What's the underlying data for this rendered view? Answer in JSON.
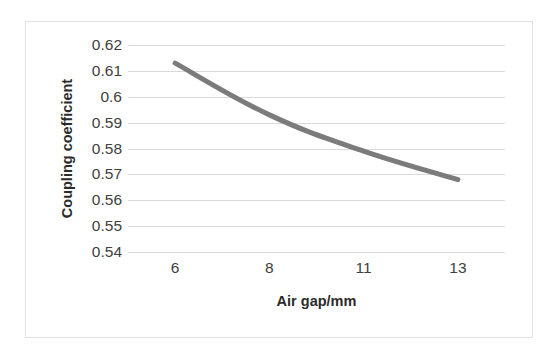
{
  "chart_data": {
    "type": "line",
    "title": "",
    "xlabel": "Air gap/mm",
    "ylabel": "Coupling coefficient",
    "categories": [
      "6",
      "8",
      "11",
      "13"
    ],
    "x": [
      6,
      8,
      11,
      13
    ],
    "values": [
      0.613,
      0.593,
      0.579,
      0.568
    ],
    "series": [
      {
        "name": "Coupling coefficient",
        "values": [
          0.613,
          0.593,
          0.579,
          0.568
        ],
        "color": "#7b7b7b"
      }
    ],
    "xtick_labels": [
      "6",
      "8",
      "11",
      "13"
    ],
    "ytick_labels": [
      "0.62",
      "0.61",
      "0.6",
      "0.59",
      "0.58",
      "0.57",
      "0.56",
      "0.55",
      "0.54"
    ],
    "ytick_values": [
      0.62,
      0.61,
      0.6,
      0.59,
      0.58,
      0.57,
      0.56,
      0.55,
      0.54
    ],
    "ylim": [
      0.54,
      0.62
    ],
    "grid": "horizontal",
    "legend": "none",
    "line_color": "#7b7b7b",
    "gridline_color": "#d9d9d9",
    "frame_color": "#e2e2e2",
    "background": "#ffffff",
    "marker": "none",
    "line_width": 5
  }
}
